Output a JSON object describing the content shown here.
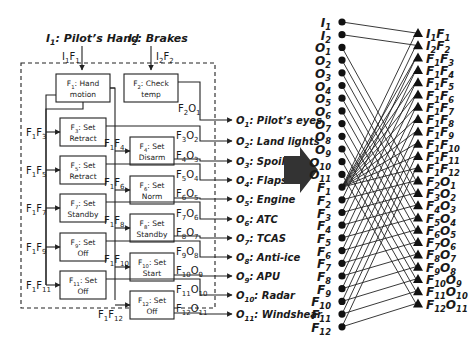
{
  "left_diagram": {
    "inputs": [
      {
        "id": "I1",
        "label_main": "I",
        "label_sub": "1",
        "label_rest": ": Pilot’s Hand",
        "flow": {
          "a": "I",
          "as": "1",
          "b": "F",
          "bs": "1"
        }
      },
      {
        "id": "I2",
        "label_main": "I",
        "label_sub": "2",
        "label_rest": ": Brakes",
        "flow": {
          "a": "I",
          "as": "2",
          "b": "F",
          "bs": "2"
        }
      }
    ],
    "functions": [
      {
        "id": "F1",
        "sub": "1",
        "line1": ": Hand",
        "line2": "motion"
      },
      {
        "id": "F2",
        "sub": "2",
        "line1": ": Check",
        "line2": "temp"
      },
      {
        "id": "F3",
        "sub": "3",
        "line1": ": Set",
        "line2": "Retract"
      },
      {
        "id": "F4",
        "sub": "4",
        "line1": ": Set",
        "line2": "Disarm"
      },
      {
        "id": "F5",
        "sub": "5",
        "line1": ": Set",
        "line2": "Retract"
      },
      {
        "id": "F6",
        "sub": "6",
        "line1": ": Set",
        "line2": "Norm"
      },
      {
        "id": "F7",
        "sub": "7",
        "line1": ": Set",
        "line2": "Standby"
      },
      {
        "id": "F8",
        "sub": "8",
        "line1": ": Set",
        "line2": "Standby"
      },
      {
        "id": "F9",
        "sub": "9",
        "line1": ": Set",
        "line2": "Off"
      },
      {
        "id": "F10",
        "sub": "10",
        "line1": ": Set",
        "line2": "Start"
      },
      {
        "id": "F11",
        "sub": "11",
        "line1": ": Set",
        "line2": "Off"
      },
      {
        "id": "F12",
        "sub": "12",
        "line1": ": Set",
        "line2": "Off"
      }
    ],
    "internal_flows": [
      "F1F3",
      "F1F4",
      "F1F5",
      "F1F6",
      "F1F7",
      "F1F8",
      "F1F9",
      "F1F10",
      "F1F11",
      "F1F12"
    ],
    "outputs": [
      {
        "id": "O1",
        "sub": "1",
        "name": ": Pilot’s eyes",
        "flow_f": "2",
        "flow_o": "1"
      },
      {
        "id": "O2",
        "sub": "2",
        "name": ": Land lights",
        "flow_f": "3",
        "flow_o": "2"
      },
      {
        "id": "O3",
        "sub": "3",
        "name": ": Spoilers",
        "flow_f": "4",
        "flow_o": "3"
      },
      {
        "id": "O4",
        "sub": "4",
        "name": ": Flaps",
        "flow_f": "5",
        "flow_o": "4"
      },
      {
        "id": "O5",
        "sub": "5",
        "name": ": Engine",
        "flow_f": "6",
        "flow_o": "5"
      },
      {
        "id": "O6",
        "sub": "6",
        "name": ": ATC",
        "flow_f": "7",
        "flow_o": "6"
      },
      {
        "id": "O7",
        "sub": "7",
        "name": ": TCAS",
        "flow_f": "8",
        "flow_o": "7"
      },
      {
        "id": "O8",
        "sub": "8",
        "name": ": Anti-ice",
        "flow_f": "9",
        "flow_o": "8"
      },
      {
        "id": "O9",
        "sub": "9",
        "name": ": APU",
        "flow_f": "10",
        "flow_o": "9"
      },
      {
        "id": "O10",
        "sub": "10",
        "name": ": Radar",
        "flow_f": "11",
        "flow_o": "10"
      },
      {
        "id": "O11",
        "sub": "11",
        "name": ": Windshear",
        "flow_f": "12",
        "flow_o": "11"
      }
    ]
  },
  "transform_arrow": {
    "icon": "right-arrow-icon",
    "color": "#333333"
  },
  "bipartite_graph": {
    "left_nodes": [
      {
        "m": "I",
        "s": "1"
      },
      {
        "m": "I",
        "s": "2"
      },
      {
        "m": "O",
        "s": "1"
      },
      {
        "m": "O",
        "s": "2"
      },
      {
        "m": "O",
        "s": "3"
      },
      {
        "m": "O",
        "s": "4"
      },
      {
        "m": "O",
        "s": "5"
      },
      {
        "m": "O",
        "s": "6"
      },
      {
        "m": "O",
        "s": "7"
      },
      {
        "m": "O",
        "s": "8"
      },
      {
        "m": "O",
        "s": "9"
      },
      {
        "m": "O",
        "s": "10"
      },
      {
        "m": "O",
        "s": "11"
      },
      {
        "m": "F",
        "s": "1"
      },
      {
        "m": "F",
        "s": "2"
      },
      {
        "m": "F",
        "s": "3"
      },
      {
        "m": "F",
        "s": "4"
      },
      {
        "m": "F",
        "s": "5"
      },
      {
        "m": "F",
        "s": "6"
      },
      {
        "m": "F",
        "s": "7"
      },
      {
        "m": "F",
        "s": "8"
      },
      {
        "m": "F",
        "s": "9"
      },
      {
        "m": "F",
        "s": "10"
      },
      {
        "m": "F",
        "s": "11"
      },
      {
        "m": "F",
        "s": "12"
      }
    ],
    "right_nodes": [
      {
        "a": "I",
        "as": "1",
        "b": "F",
        "bs": "1"
      },
      {
        "a": "I",
        "as": "2",
        "b": "F",
        "bs": "2"
      },
      {
        "a": "F",
        "as": "1",
        "b": "F",
        "bs": "3"
      },
      {
        "a": "F",
        "as": "1",
        "b": "F",
        "bs": "4"
      },
      {
        "a": "F",
        "as": "1",
        "b": "F",
        "bs": "5"
      },
      {
        "a": "F",
        "as": "1",
        "b": "F",
        "bs": "6"
      },
      {
        "a": "F",
        "as": "1",
        "b": "F",
        "bs": "7"
      },
      {
        "a": "F",
        "as": "1",
        "b": "F",
        "bs": "8"
      },
      {
        "a": "F",
        "as": "1",
        "b": "F",
        "bs": "9"
      },
      {
        "a": "F",
        "as": "1",
        "b": "F",
        "bs": "10"
      },
      {
        "a": "F",
        "as": "1",
        "b": "F",
        "bs": "11"
      },
      {
        "a": "F",
        "as": "1",
        "b": "F",
        "bs": "12"
      },
      {
        "a": "F",
        "as": "2",
        "b": "O",
        "bs": "1"
      },
      {
        "a": "F",
        "as": "3",
        "b": "O",
        "bs": "2"
      },
      {
        "a": "F",
        "as": "4",
        "b": "O",
        "bs": "3"
      },
      {
        "a": "F",
        "as": "5",
        "b": "O",
        "bs": "4"
      },
      {
        "a": "F",
        "as": "6",
        "b": "O",
        "bs": "5"
      },
      {
        "a": "F",
        "as": "7",
        "b": "O",
        "bs": "6"
      },
      {
        "a": "F",
        "as": "8",
        "b": "O",
        "bs": "7"
      },
      {
        "a": "F",
        "as": "9",
        "b": "O",
        "bs": "8"
      },
      {
        "a": "F",
        "as": "10",
        "b": "O",
        "bs": "9"
      },
      {
        "a": "F",
        "as": "11",
        "b": "O",
        "bs": "10"
      },
      {
        "a": "F",
        "as": "12",
        "b": "O",
        "bs": "11"
      }
    ],
    "left_node_marker": "circle",
    "right_node_marker": "triangle"
  }
}
